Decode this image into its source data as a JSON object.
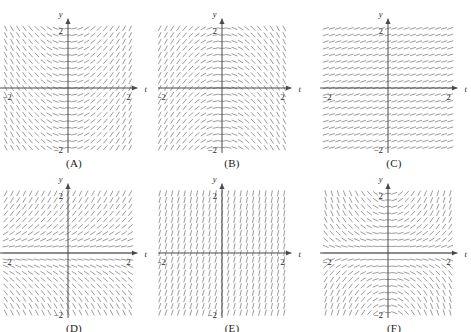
{
  "figure": {
    "kind": "slope-field-multiple-choice-figure",
    "panel_count": 6,
    "rows": 2,
    "columns": 3,
    "background_color": "#ffffff",
    "mark_color": "#8a8a8a",
    "axis_color": "#4a4a4a",
    "text_color": "#2b2b2b"
  },
  "axis_labels": {
    "vertical": "y",
    "horizontal": "t",
    "top_tick": "2",
    "right_tick": "2",
    "left_tick": "−2",
    "bottom_tick": "−2"
  },
  "chart_data": [
    {
      "type": "scatter",
      "id": "A",
      "label": "(A)",
      "title": "",
      "xlabel": "t",
      "ylabel": "y",
      "xlim": [
        -2.6,
        2.6
      ],
      "ylim": [
        -2.45,
        2.45
      ],
      "xticks": [
        -2,
        2
      ],
      "xticklabels": [
        "−2",
        "2"
      ],
      "yticks": [
        -2,
        2
      ],
      "yticklabels": [
        "−2",
        "2"
      ],
      "grid": false,
      "legend": null,
      "slope_rule": "t_only_positive",
      "slope_description": "Slope depends only on t: negative (marks lean like backslash) for t<0 and positive (marks lean like forward slash) for t>0; magnitude grows with |t|, nearly horizontal near the y-axis.",
      "grid_cols": 21,
      "grid_rows": 19
    },
    {
      "type": "scatter",
      "id": "B",
      "label": "(B)",
      "title": "",
      "xlabel": "t",
      "ylabel": "y",
      "xlim": [
        -2.6,
        2.6
      ],
      "ylim": [
        -2.45,
        2.45
      ],
      "xticks": [
        -2,
        2
      ],
      "xticklabels": [
        "−2",
        "2"
      ],
      "yticks": [
        -2,
        2
      ],
      "yticklabels": [
        "−2",
        "2"
      ],
      "grid": false,
      "legend": null,
      "slope_rule": "t_only_negative",
      "slope_description": "Slope depends only on t with opposite sign to (A): positive for t<0 and negative for t>0; marks are steep at the left and right edges and flatten to horizontal along the y-axis.",
      "grid_cols": 21,
      "grid_rows": 19
    },
    {
      "type": "scatter",
      "id": "C",
      "label": "(C)",
      "title": "",
      "xlabel": "t",
      "ylabel": "y",
      "xlim": [
        -2.6,
        2.6
      ],
      "ylim": [
        -2.45,
        2.45
      ],
      "xticks": [
        -2,
        2
      ],
      "xticklabels": [
        "−2",
        "2"
      ],
      "yticks": [
        -2,
        2
      ],
      "yticklabels": [
        "−2",
        "2"
      ],
      "grid": false,
      "legend": null,
      "slope_rule": "constant_shallow",
      "slope_description": "Nearly uniform field: every mark has the same small positive slope regardless of t or y.",
      "grid_cols": 21,
      "grid_rows": 19
    },
    {
      "type": "scatter",
      "id": "D",
      "label": "(D)",
      "title": "",
      "xlabel": "t",
      "ylabel": "y",
      "xlim": [
        -2.6,
        2.6
      ],
      "ylim": [
        -2.45,
        2.45
      ],
      "xticks": [
        -2,
        2
      ],
      "xticklabels": [
        "−2",
        "2"
      ],
      "yticks": [
        -2,
        2
      ],
      "yticklabels": [
        "−2",
        "2"
      ],
      "grid": false,
      "legend": null,
      "slope_rule": "y_only_positive",
      "slope_description": "Slope depends only on y: positive above the t-axis and negative below it, horizontal along y=0; magnitude grows with |y|.",
      "grid_cols": 21,
      "grid_rows": 19
    },
    {
      "type": "scatter",
      "id": "E",
      "label": "(E)",
      "title": "",
      "xlabel": "t",
      "ylabel": "y",
      "xlim": [
        -2.6,
        2.6
      ],
      "ylim": [
        -2.45,
        2.45
      ],
      "xticks": [
        -2,
        2
      ],
      "xticklabels": [
        "−2",
        "2"
      ],
      "yticks": [
        -2,
        2
      ],
      "yticklabels": [
        "−2",
        "2"
      ],
      "grid": false,
      "legend": null,
      "slope_rule": "steep_uniform",
      "slope_description": "Steep, nearly vertical marks almost everywhere, tilting slightly with position.",
      "grid_cols": 21,
      "grid_rows": 19
    },
    {
      "type": "scatter",
      "id": "F",
      "label": "(F)",
      "title": "",
      "xlabel": "t",
      "ylabel": "y",
      "xlim": [
        -2.6,
        2.6
      ],
      "ylim": [
        -2.45,
        2.45
      ],
      "xticks": [
        -2,
        2
      ],
      "xticklabels": [
        "−2",
        "2"
      ],
      "yticks": [
        -2,
        2
      ],
      "yticklabels": [
        "−2",
        "2"
      ],
      "grid": false,
      "legend": null,
      "slope_rule": "product_ty",
      "slope_description": "Quadrant-dependent field: slopes steepen away from the axes and change sign across both axes, flattening near t=0 and y=0.",
      "grid_cols": 21,
      "grid_rows": 19
    }
  ]
}
